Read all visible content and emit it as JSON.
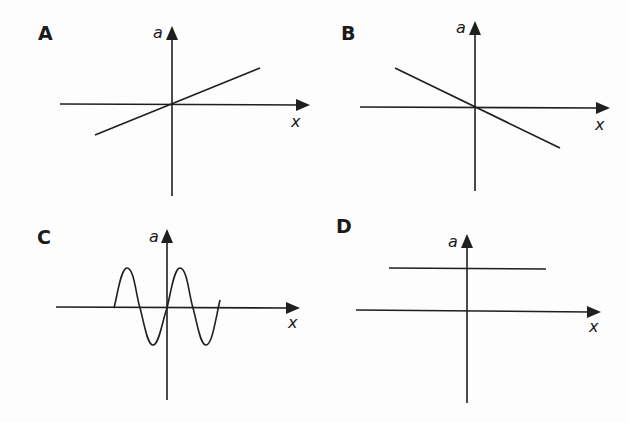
{
  "figure": {
    "panels": [
      {
        "label": "A",
        "y_axis_label": "a",
        "x_axis_label": "x",
        "graph": "line with positive slope through origin"
      },
      {
        "label": "B",
        "y_axis_label": "a",
        "x_axis_label": "x",
        "graph": "line with negative slope through origin"
      },
      {
        "label": "C",
        "y_axis_label": "a",
        "x_axis_label": "x",
        "graph": "sine wave oscillating about origin"
      },
      {
        "label": "D",
        "y_axis_label": "a",
        "x_axis_label": "x",
        "graph": "horizontal line above x-axis (constant a)"
      }
    ]
  },
  "colors": {
    "ink": "#1f1f1f",
    "background": "#fdfdfd"
  }
}
